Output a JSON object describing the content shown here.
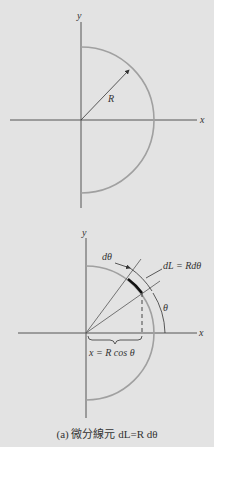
{
  "figure": {
    "top_diagram": {
      "axis_x_label": "x",
      "axis_y_label": "y",
      "radius_label": "R"
    },
    "bottom_diagram": {
      "axis_x_label": "x",
      "axis_y_label": "y",
      "dtheta_label": "dθ",
      "dL_label": "dL = Rdθ",
      "theta_label": "θ",
      "x_expr_label": "x = R cos θ"
    },
    "caption": "(a) 微分線元 dL=R dθ",
    "colors": {
      "background": "#e3e3e3",
      "axis": "#444444",
      "arc": "#a0a0a0",
      "element": "#111111"
    }
  }
}
